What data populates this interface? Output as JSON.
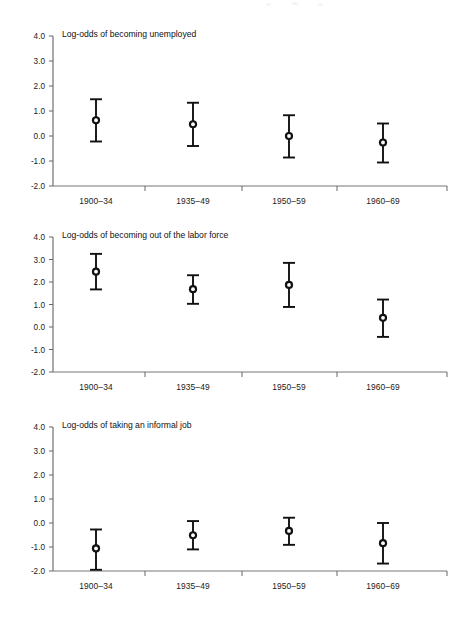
{
  "figure": {
    "background": "#ffffff",
    "marker_color": "#111111",
    "axis_color": "#666666",
    "text_color": "#1a1a1a"
  },
  "chart_data": [
    {
      "type": "scatter",
      "title": "Log-odds of becoming unemployed",
      "xlabel": "",
      "ylabel": "",
      "ylim": [
        -2.0,
        4.0
      ],
      "yticks": [
        "4.0",
        "3.0",
        "2.0",
        "1.0",
        "0.0",
        "-1.0",
        "-2.0"
      ],
      "ytick_values": [
        4.0,
        3.0,
        2.0,
        1.0,
        0.0,
        -1.0,
        -2.0
      ],
      "grid": false,
      "legend": "none",
      "categories": [
        "1900–34",
        "1935–49",
        "1950–59",
        "1960–69"
      ],
      "values": [
        0.63,
        0.47,
        0.0,
        -0.26
      ],
      "ci_low": [
        -0.22,
        -0.4,
        -0.86,
        -1.06
      ],
      "ci_high": [
        1.47,
        1.33,
        0.83,
        0.5
      ]
    },
    {
      "type": "scatter",
      "title": "Log-odds of becoming out of the labor force",
      "xlabel": "",
      "ylabel": "",
      "ylim": [
        -2.0,
        4.0
      ],
      "yticks": [
        "4.0",
        "3.0",
        "2.0",
        "1.0",
        "0.0",
        "-1.0",
        "-2.0"
      ],
      "ytick_values": [
        4.0,
        3.0,
        2.0,
        1.0,
        0.0,
        -1.0,
        -2.0
      ],
      "grid": false,
      "legend": "none",
      "categories": [
        "1900–34",
        "1935–49",
        "1950–59",
        "1960–69"
      ],
      "values": [
        2.46,
        1.68,
        1.87,
        0.41
      ],
      "ci_low": [
        1.67,
        1.03,
        0.89,
        -0.44
      ],
      "ci_high": [
        3.25,
        2.3,
        2.85,
        1.22
      ]
    },
    {
      "type": "scatter",
      "title": "Log-odds of taking an informal job",
      "xlabel": "",
      "ylabel": "",
      "ylim": [
        -2.0,
        4.0
      ],
      "yticks": [
        "4.0",
        "3.0",
        "2.0",
        "1.0",
        "0.0",
        "-1.0",
        "-2.0"
      ],
      "ytick_values": [
        4.0,
        3.0,
        2.0,
        1.0,
        0.0,
        -1.0,
        -2.0
      ],
      "grid": false,
      "legend": "none",
      "categories": [
        "1900–34",
        "1935–49",
        "1950–59",
        "1960–69"
      ],
      "values": [
        -1.06,
        -0.51,
        -0.33,
        -0.84
      ],
      "ci_low": [
        -1.95,
        -1.1,
        -0.91,
        -1.69
      ],
      "ci_high": [
        -0.27,
        0.08,
        0.22,
        0.0
      ]
    }
  ]
}
